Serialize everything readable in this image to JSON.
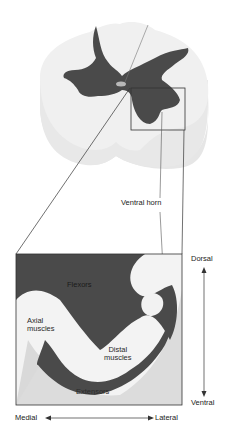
{
  "figure": {
    "labels": {
      "ventral_horn": "Ventral horn",
      "dorsal": "Dorsal",
      "ventral": "Ventral",
      "medial": "Medial",
      "lateral": "Lateral",
      "flexors": "Flexors",
      "axial_muscles_line1": "Axial",
      "axial_muscles_line2": "muscles",
      "distal_muscles_line1": "Distal",
      "distal_muscles_line2": "muscles",
      "extensors": "Extensors"
    },
    "colors": {
      "gray_matter": "#4a4a4a",
      "white_matter": "#efefef",
      "cord_side": "#e4e4e4",
      "outline": "#333333",
      "light_region": "#f4f4f4",
      "mid_region": "#d8d8d8"
    }
  }
}
